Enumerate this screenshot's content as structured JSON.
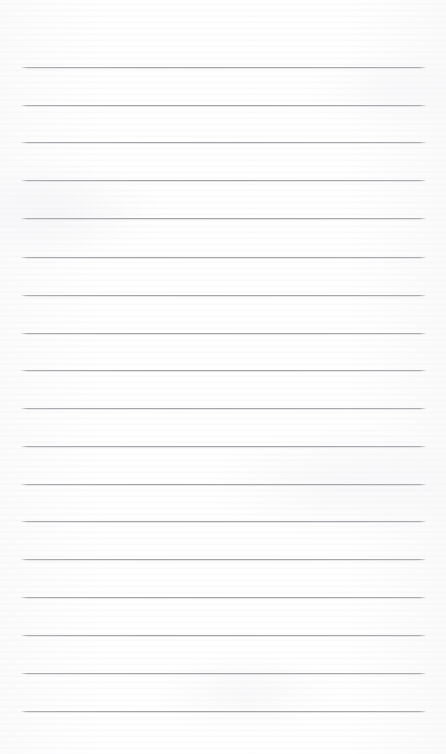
{
  "page": {
    "name": "lined-notebook-paper",
    "width": 446,
    "height": 754,
    "background_color": "#fdfdfd",
    "content_text": ""
  },
  "ruling": {
    "type": "horizontal-ruled",
    "line_count": 18,
    "line_color": "#a9a9ad",
    "line_thickness_px": 1,
    "line_spacing_px": 37.9,
    "line_left_px": 21,
    "line_right_px": 426,
    "line_width_px": 405,
    "first_line_y_px": 67,
    "last_line_y_px": 711,
    "margin_top_px": 67,
    "margin_bottom_px": 43,
    "margin_left_px": 21,
    "margin_right_px": 20,
    "vertical_margin_rule": false,
    "lines_y": [
      67,
      105,
      142,
      180,
      218,
      257,
      295,
      333,
      370,
      408,
      446,
      484,
      521,
      559,
      597,
      635,
      673,
      711
    ]
  }
}
